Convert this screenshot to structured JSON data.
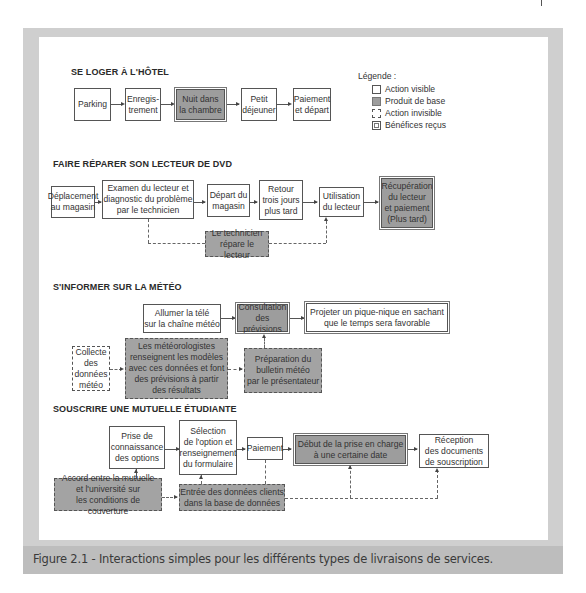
{
  "sections": {
    "hotel": {
      "title": "SE LOGER À L'HÔTEL",
      "boxes": [
        "Parking",
        "Enregis-\ntrement",
        "Nuit dans\nla chambre",
        "Petit\ndéjeuner",
        "Paiement\net départ"
      ]
    },
    "dvd": {
      "title": "FAIRE RÉPARER SON LECTEUR DE DVD",
      "boxes": [
        "Déplacement\nau magasin",
        "Examen du lecteur et\ndiagnostic du problème\npar le technicien",
        "Départ du\nmagasin",
        "Retour\ntrois jours\nplus tard",
        "Utilisation\ndu lecteur",
        "Récupération\ndu lecteur\net paiement\n(Plus tard)"
      ],
      "invisible": [
        "Le technicien\nrépare le lecteur"
      ]
    },
    "meteo": {
      "title": "S'INFORMER SUR LA MÉTÉO",
      "boxes": [
        "Allumer la télé\nsur la chaîne météo",
        "Consultation\ndes prévisions",
        "Projeter un pique-nique en sachant\nque le temps sera favorable"
      ],
      "invisible": [
        "Collecte\ndes\ndonnées\nmétéo",
        "Les météorologistes\nrenseignent les modèles\navec ces données et font\ndes prévisions à partir\ndes résultats",
        "Préparation du\nbulletin météo\npar le présentateur"
      ]
    },
    "mutuelle": {
      "title": "SOUSCRIRE UNE MUTUELLE ÉTUDIANTE",
      "boxes": [
        "Prise de\nconnaissance\ndes options",
        "Sélection\nde l'option et\nrenseignement\ndu formulaire",
        "Paiement",
        "Début de la prise en charge\nà une certaine date",
        "Réception\ndes documents\nde souscription"
      ],
      "invisible": [
        "Accord entre la mutuelle\net l'université sur\nles conditions de couverture",
        "Entrée des données clients\ndans la base de données"
      ]
    }
  },
  "legend": {
    "title": "Légende :",
    "items": [
      "Action visible",
      "Produit de base",
      "Action invisible",
      "Bénéfices reçus"
    ]
  },
  "caption": "Figure 2.1 - Interactions simples pour les différents types de livraisons de services.",
  "colors": {
    "frame": "#cfcfcf",
    "caption_bar": "#bdbdbd",
    "core_product": "#9d9d9d",
    "invisible_action": "#a3a3a3"
  }
}
